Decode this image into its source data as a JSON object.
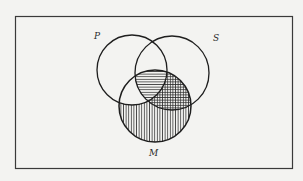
{
  "diagram": {
    "type": "venn-diagram",
    "sets": [
      {
        "label": "P",
        "cx": 132,
        "cy": 70,
        "r": 35
      },
      {
        "label": "S",
        "cx": 172,
        "cy": 73,
        "r": 37
      },
      {
        "label": "M",
        "cx": 155,
        "cy": 106,
        "r": 36
      }
    ],
    "labels": {
      "p": "P",
      "s": "S",
      "m": "M"
    },
    "shading": [
      {
        "region": "S∩M",
        "pattern": "horizontal-lines"
      },
      {
        "region": "M−P",
        "pattern": "vertical-lines"
      }
    ],
    "colors": {
      "stroke": "#1e1e1e",
      "hatch": "#2b2b2b",
      "background": "#f3f3f1",
      "frame": "#3a3a3a"
    }
  }
}
